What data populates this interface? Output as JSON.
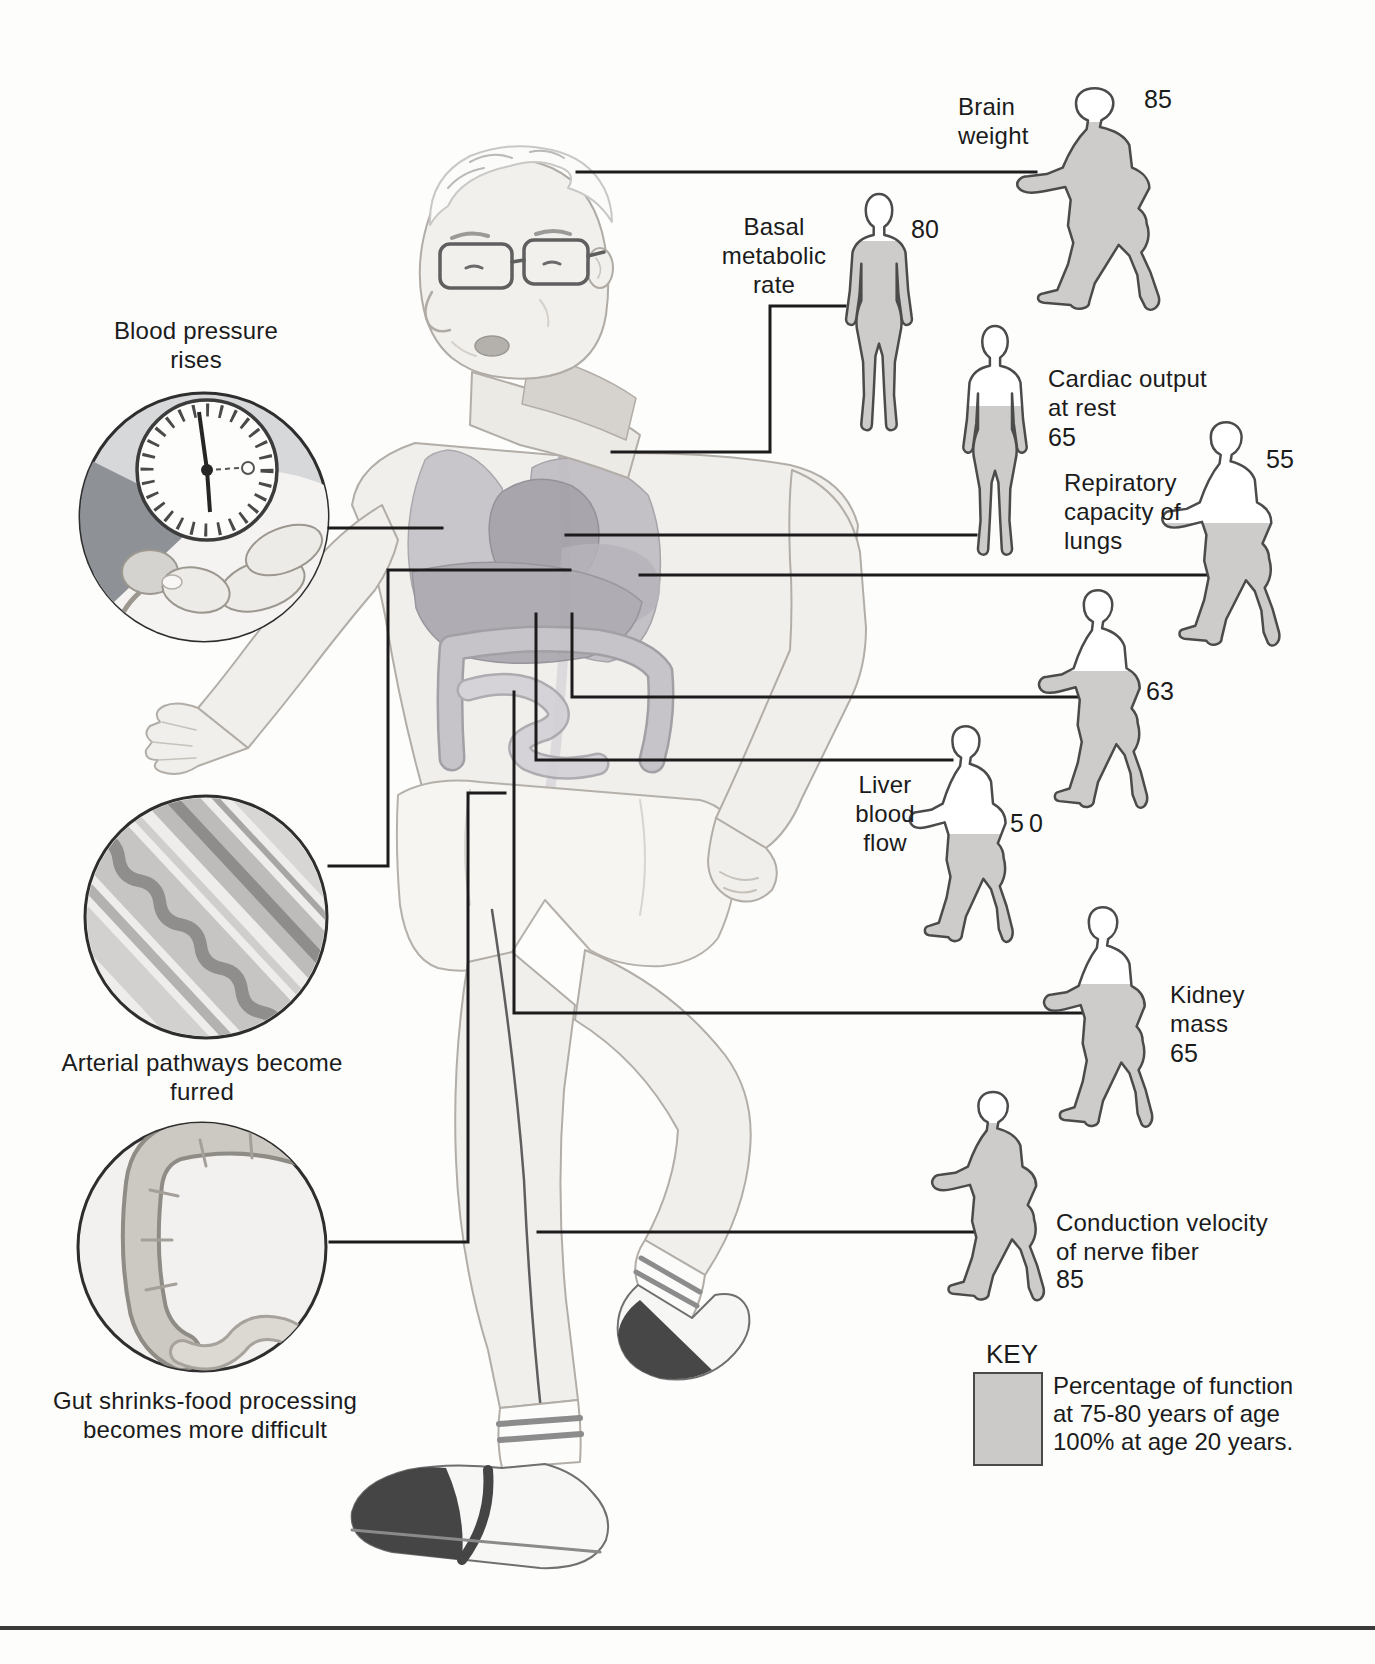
{
  "figures": [
    {
      "id": "brain-weight",
      "label": "Brain weight",
      "value": 85,
      "pose": "runner"
    },
    {
      "id": "basal-metabolic-rate",
      "label": "Basal metabolic rate",
      "value": 80,
      "pose": "stander"
    },
    {
      "id": "cardiac-output-at-rest",
      "label": "Cardiac output at rest",
      "value": 65,
      "pose": "stander"
    },
    {
      "id": "respiratory-capacity",
      "label": "Repiratory capacity of lungs",
      "value": 55,
      "pose": "runner"
    },
    {
      "id": "unlabeled",
      "label": "",
      "value": 63,
      "pose": "runner"
    },
    {
      "id": "liver-blood-flow",
      "label": "Liver blood flow",
      "value": 50,
      "pose": "runner"
    },
    {
      "id": "kidney-mass",
      "label": "Kidney mass",
      "value": 65,
      "pose": "runner"
    },
    {
      "id": "nerve-conduction-velocity",
      "label": "Conduction velocity of nerve fiber",
      "value": 85,
      "pose": "runner"
    }
  ],
  "left_panel": {
    "blood_pressure": {
      "caption": "Blood pressure rises"
    },
    "arteries": {
      "caption": "Arterial pathways become furred"
    },
    "gut": {
      "caption": "Gut shrinks-food processing becomes more difficult"
    }
  },
  "key": {
    "title": "KEY",
    "lines": [
      "Percentage of function",
      "at 75-80 years of age",
      "100% at age 20 years."
    ],
    "swatch_color": "#cbcac9"
  },
  "colors": {
    "silhouette_fill": "#cdcccb",
    "silhouette_outline": "#4b4b4b",
    "connector": "#1c1c1c"
  }
}
